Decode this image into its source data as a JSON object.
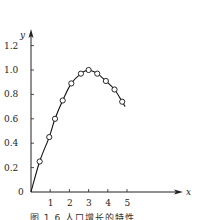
{
  "chart_data": {
    "type": "line",
    "title": "",
    "xlabel": "x",
    "ylabel": "y",
    "xlim": [
      0,
      5.5
    ],
    "ylim": [
      0,
      1.3
    ],
    "xticks": [
      1,
      2,
      3,
      4,
      5
    ],
    "yticks": [
      0,
      0.2,
      0.4,
      0.6,
      0.8,
      1.0,
      1.2
    ],
    "ytick_labels": [
      "0",
      "0.2",
      "0.4",
      "0.6",
      "0.8",
      "1.0",
      "1.2"
    ],
    "origin_label": "0",
    "grid": false,
    "legend": null,
    "series": [
      {
        "name": "data",
        "marker": "open-circle",
        "line": "solid",
        "curve_start": [
          0,
          0
        ],
        "curve_end": [
          4.9,
          0.7
        ],
        "x": [
          0.45,
          0.95,
          1.25,
          1.65,
          2.1,
          2.6,
          3.0,
          3.45,
          3.9,
          4.35,
          4.75
        ],
        "y": [
          0.25,
          0.45,
          0.6,
          0.75,
          0.89,
          0.97,
          1.0,
          0.97,
          0.91,
          0.84,
          0.74
        ]
      }
    ]
  },
  "caption": "图 1.6   人口增长的特性"
}
